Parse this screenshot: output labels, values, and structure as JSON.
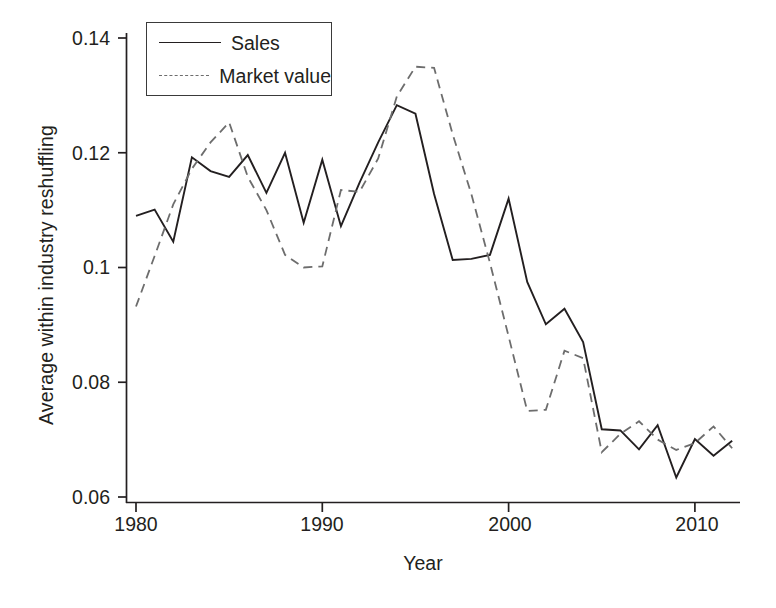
{
  "chart_data": {
    "type": "line",
    "title": "",
    "xlabel": "Year",
    "ylabel": "Average within industry reshuffling",
    "xlim": [
      1980,
      2012
    ],
    "ylim": [
      0.06,
      0.1425
    ],
    "grid": false,
    "legend_position": "top-left",
    "xticks": [
      1980,
      1990,
      2000,
      2010
    ],
    "xtick_labels": [
      "1980",
      "1990",
      "2000",
      "2010"
    ],
    "yticks": [
      0.06,
      0.08,
      0.1,
      0.12,
      0.14
    ],
    "ytick_labels": [
      "0.06",
      "0.08",
      "0.1",
      "0.12",
      "0.14"
    ],
    "x": [
      1980,
      1981,
      1982,
      1983,
      1984,
      1985,
      1986,
      1987,
      1988,
      1989,
      1990,
      1991,
      1992,
      1993,
      1994,
      1995,
      1996,
      1997,
      1998,
      1999,
      2000,
      2001,
      2002,
      2003,
      2004,
      2005,
      2006,
      2007,
      2008,
      2009,
      2010,
      2011,
      2012
    ],
    "series": [
      {
        "name": "Sales",
        "style": "solid",
        "color": "#231f20",
        "values": [
          0.109,
          0.1101,
          0.1045,
          0.1192,
          0.1168,
          0.1158,
          0.1196,
          0.113,
          0.12,
          0.1078,
          0.1188,
          0.1072,
          0.1148,
          0.1218,
          0.1283,
          0.1268,
          0.1128,
          0.1013,
          0.1015,
          0.1022,
          0.112,
          0.0975,
          0.0901,
          0.0928,
          0.087,
          0.0718,
          0.0716,
          0.0683,
          0.0725,
          0.0634,
          0.0701,
          0.0672,
          0.0698
        ]
      },
      {
        "name": "Market value",
        "style": "dashed",
        "color": "#6d6d6d",
        "values": [
          0.0932,
          0.102,
          0.111,
          0.1172,
          0.1218,
          0.1253,
          0.1158,
          0.11,
          0.1022,
          0.1,
          0.1002,
          0.1135,
          0.1132,
          0.119,
          0.1298,
          0.135,
          0.1348,
          0.1232,
          0.1128,
          0.1008,
          0.088,
          0.075,
          0.0752,
          0.0855,
          0.0842,
          0.0678,
          0.071,
          0.0732,
          0.07,
          0.0682,
          0.0694,
          0.0723,
          0.0685
        ]
      }
    ]
  },
  "axes": {
    "x_axis_name": "x-axis",
    "y_axis_name": "y-axis"
  }
}
